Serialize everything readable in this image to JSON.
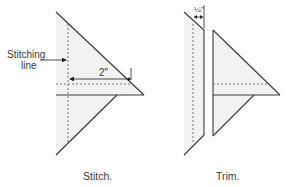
{
  "figures": [
    {
      "id": "stitch",
      "caption": "Stitch.",
      "callout_label_line1": "Stitching",
      "callout_label_line2": "line",
      "dimension": "2\""
    },
    {
      "id": "trim",
      "caption": "Trim.",
      "dimension": "¼\""
    }
  ],
  "colors": {
    "fill": "#f2f2f2",
    "stroke": "#3a3a3a",
    "dashed": "#6a6a6a"
  }
}
